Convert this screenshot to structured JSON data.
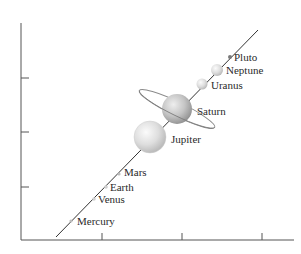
{
  "diagram": {
    "axes": {
      "x_ticks": 3,
      "y_ticks": 3
    },
    "planets": [
      {
        "name": "Mercury"
      },
      {
        "name": "Venus"
      },
      {
        "name": "Earth"
      },
      {
        "name": "Mars"
      },
      {
        "name": "Jupiter"
      },
      {
        "name": "Saturn"
      },
      {
        "name": "Uranus"
      },
      {
        "name": "Neptune"
      },
      {
        "name": "Pluto"
      }
    ]
  },
  "colors": {
    "axis": "#555555",
    "line": "#333333",
    "sphere_light": "#f4f4f4",
    "sphere_mid": "#d8d8d8",
    "sphere_dark": "#9e9e9e",
    "label": "#2a2a2a"
  }
}
